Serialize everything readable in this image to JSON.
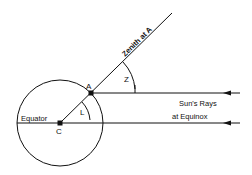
{
  "diagram": {
    "labels": {
      "point_a": "A",
      "point_c": "C",
      "equator": "Equator",
      "zenith": "Zenith at A",
      "angle_z": "Z",
      "angle_l": "L",
      "suns_rays_line1": "Sun's Rays",
      "suns_rays_line2": "at Equinox"
    },
    "colors": {
      "stroke": "#111111",
      "background": "#ffffff"
    }
  }
}
